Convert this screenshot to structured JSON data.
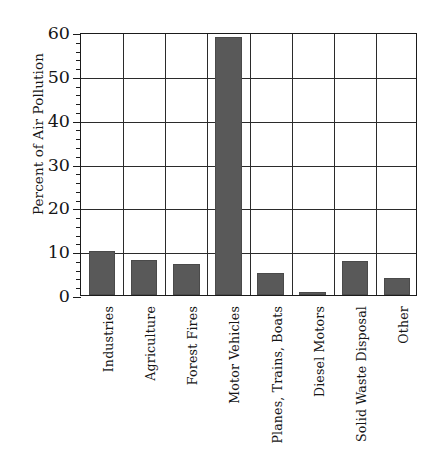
{
  "chart_data": {
    "type": "bar",
    "title": "",
    "xlabel": "",
    "ylabel": "Percent of Air Pollution",
    "categories": [
      "Industries",
      "Agriculture",
      "Forest Fires",
      "Motor Vehicles",
      "Planes, Trains, Boats",
      "Diesel Motors",
      "Solid Waste Disposal",
      "Other"
    ],
    "values": [
      10.0,
      8.0,
      7.0,
      58.8,
      5.0,
      0.6,
      7.8,
      3.8
    ],
    "ylim": [
      0,
      60
    ],
    "yticks": [
      0,
      10,
      20,
      30,
      40,
      50,
      60
    ],
    "ytick_labels": [
      "0",
      "10",
      "20",
      "30",
      "40",
      "50",
      "60"
    ],
    "minor_tick_interval": 2,
    "grid": "horizontal-and-vertical",
    "legend": "none",
    "bar_color": "#595959",
    "axis_color": "#1b1b1b",
    "background_color": "#ffffff"
  }
}
